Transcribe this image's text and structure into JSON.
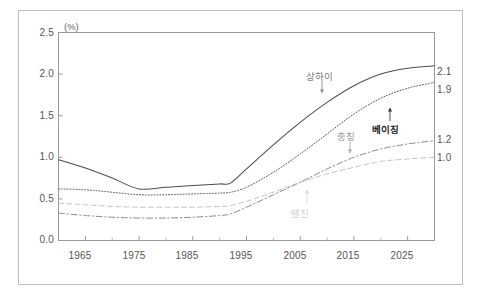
{
  "chart_data": {
    "type": "line",
    "title": "",
    "subtitle": "",
    "xlabel": "",
    "ylabel": "",
    "unit_label": "(%)",
    "grid": false,
    "legend_position": "inline-annotations",
    "xlim": [
      1960,
      2030
    ],
    "ylim": [
      0.0,
      2.5
    ],
    "yticks": [
      "0.0",
      "0.5",
      "1.0",
      "1.5",
      "2.0",
      "2.5"
    ],
    "ytick_values": [
      0.0,
      0.5,
      1.0,
      1.5,
      2.0,
      2.5
    ],
    "xticks": [
      "1965",
      "1975",
      "1985",
      "1995",
      "2005",
      "2015",
      "2025"
    ],
    "xtick_values": [
      1965,
      1975,
      1985,
      1995,
      2005,
      2015,
      2025
    ],
    "xminor_values": [
      1960,
      1970,
      1980,
      1990,
      2000,
      2010,
      2020,
      2030
    ],
    "x": [
      1960,
      1965,
      1970,
      1975,
      1980,
      1985,
      1990,
      1992,
      1995,
      2000,
      2005,
      2010,
      2015,
      2020,
      2025,
      2030
    ],
    "series": [
      {
        "name": "상하이",
        "style": "solid",
        "color": "#4d4d4d",
        "end_value": "2.1",
        "label_color": "#777777",
        "values": [
          0.97,
          0.87,
          0.75,
          0.62,
          0.64,
          0.66,
          0.68,
          0.69,
          0.86,
          1.15,
          1.42,
          1.66,
          1.86,
          2.0,
          2.07,
          2.1
        ]
      },
      {
        "name": "베이징",
        "style": "dotted",
        "color": "#555555",
        "end_value": "1.9",
        "label_color": "#1a1a1a",
        "values": [
          0.62,
          0.61,
          0.58,
          0.55,
          0.55,
          0.56,
          0.57,
          0.58,
          0.64,
          0.82,
          1.04,
          1.28,
          1.52,
          1.71,
          1.83,
          1.9
        ]
      },
      {
        "name": "충칭",
        "style": "dash-dot",
        "color": "#8a8a8a",
        "end_value": "1.2",
        "label_color": "#999999",
        "values": [
          0.33,
          0.3,
          0.28,
          0.27,
          0.27,
          0.28,
          0.3,
          0.32,
          0.4,
          0.55,
          0.7,
          0.86,
          1.0,
          1.1,
          1.16,
          1.2
        ]
      },
      {
        "name": "톈진",
        "style": "dashed",
        "color": "#c4c4c4",
        "end_value": "1.0",
        "label_color": "#cfcfcf",
        "values": [
          0.45,
          0.43,
          0.41,
          0.4,
          0.4,
          0.4,
          0.41,
          0.42,
          0.47,
          0.58,
          0.7,
          0.8,
          0.88,
          0.95,
          0.98,
          1.0
        ]
      }
    ],
    "annotations": [
      {
        "text": "상하이",
        "target_series": "상하이",
        "arrow": "down"
      },
      {
        "text": "베이징",
        "target_series": "베이징",
        "arrow": "up"
      },
      {
        "text": "충칭",
        "target_series": "충칭",
        "arrow": "down"
      },
      {
        "text": "톈진",
        "target_series": "톈진",
        "arrow": "up"
      }
    ],
    "end_labels": [
      "2.1",
      "1.9",
      "1.2",
      "1.0"
    ]
  },
  "axes": {
    "unit": "(%)",
    "y_labels": [
      "2.5",
      "2.0",
      "1.5",
      "1.0",
      "0.5",
      "0.0"
    ],
    "x_labels": [
      "1965",
      "1975",
      "1985",
      "1995",
      "2005",
      "2015",
      "2025"
    ]
  },
  "end_values": {
    "shanghai": "2.1",
    "beijing": "1.9",
    "chongqing": "1.2",
    "tianjin": "1.0"
  },
  "series_labels": {
    "shanghai": "상하이",
    "beijing": "베이징",
    "chongqing": "충칭",
    "tianjin": "톈진"
  },
  "caption": {
    "line": ""
  }
}
